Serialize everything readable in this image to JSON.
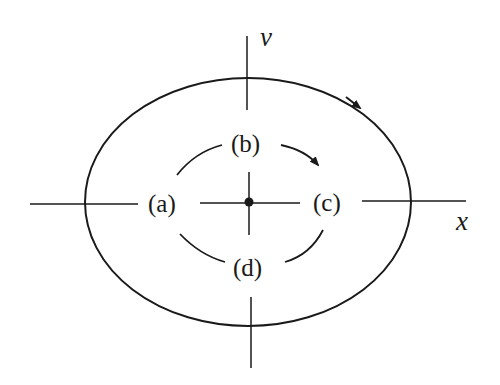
{
  "diagram": {
    "type": "phase-plane",
    "axes": {
      "horizontal_label": "x",
      "vertical_label": "v"
    },
    "points": [
      {
        "id": "a",
        "label": "(a)"
      },
      {
        "id": "b",
        "label": "(b)"
      },
      {
        "id": "c",
        "label": "(c)"
      },
      {
        "id": "d",
        "label": "(d)"
      }
    ],
    "outer_orbit": {
      "style": "solid",
      "direction": "clockwise"
    },
    "inner_orbit": {
      "style": "dashed",
      "direction": "clockwise"
    },
    "equilibrium": {
      "style": "filled-dot"
    },
    "colors": {
      "stroke": "#1a1a1a",
      "background": "#ffffff"
    }
  }
}
